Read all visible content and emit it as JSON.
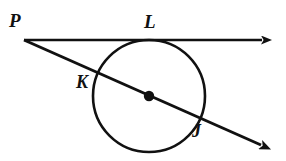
{
  "figure": {
    "width": 286,
    "height": 161,
    "background_color": "#ffffff",
    "stroke_color": "#111111"
  },
  "labels": {
    "p": "P",
    "l": "L",
    "k": "K",
    "j": "J"
  },
  "label_positions": {
    "p": {
      "x": 9,
      "y": 11,
      "font_size": 19
    },
    "l": {
      "x": 144,
      "y": 12,
      "font_size": 19
    },
    "k": {
      "x": 76,
      "y": 73,
      "font_size": 18
    },
    "j": {
      "x": 192,
      "y": 122,
      "font_size": 18
    }
  },
  "geometry": {
    "circle": {
      "center_x": 149,
      "center_y": 96,
      "radius": 56,
      "stroke_width": 2.6,
      "fill": "none"
    },
    "center_dot": {
      "x": 149,
      "y": 96,
      "radius": 5.2,
      "fill": "#111111"
    },
    "tangent_line": {
      "name": "tangent-PL",
      "x1": 24,
      "y1": 40,
      "x2": 270,
      "y2": 40,
      "stroke_width": 2.6,
      "arrow_end": true,
      "tangent_point_x": 149,
      "tangent_point_y": 40
    },
    "secant_line": {
      "name": "secant-PKJ",
      "x1": 24,
      "y1": 40,
      "x2": 270,
      "y2": 149,
      "stroke_width": 3.0,
      "arrow_end": true
    },
    "points": {
      "P": {
        "x": 24,
        "y": 40
      },
      "L": {
        "x": 149,
        "y": 40
      },
      "K": {
        "x": 100,
        "y": 74
      },
      "J": {
        "x": 198,
        "y": 118
      },
      "center": {
        "x": 149,
        "y": 96
      }
    },
    "arrowheads": {
      "tangent_tip_x": 272,
      "tangent_tip_y": 40,
      "secant_tip_x": 272,
      "secant_tip_y": 150
    }
  }
}
